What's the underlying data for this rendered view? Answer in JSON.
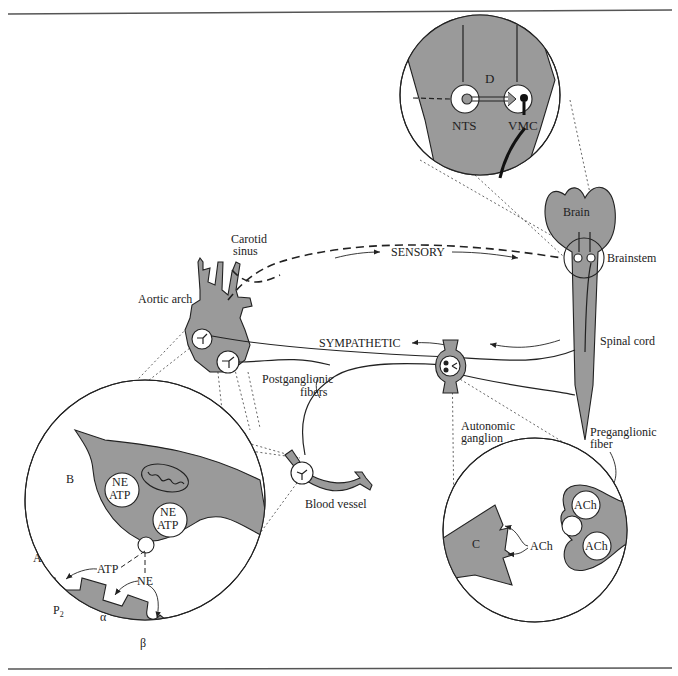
{
  "figure": {
    "labels": {
      "panel_d": "D",
      "nts": "NTS",
      "vmc": "VMC",
      "brain": "Brain",
      "brainstem": "Brainstem",
      "spinal_cord": "Spinal cord",
      "carotid_sinus_1": "Carotid",
      "carotid_sinus_2": "sinus",
      "aortic_arch": "Aortic arch",
      "sensory": "SENSORY",
      "sympathetic": "SYMPATHETIC",
      "postganglionic_1": "Postganglionic",
      "postganglionic_2": "fibers",
      "autonomic_ganglion_1": "Autonomic",
      "autonomic_ganglion_2": "ganglion",
      "preganglionic_1": "Preganglionic",
      "preganglionic_2": "fiber",
      "blood_vessel": "Blood vessel",
      "panel_b": "B",
      "panel_a": "A",
      "panel_c": "C",
      "ne": "NE",
      "atp": "ATP",
      "p2": "P",
      "p2_sub": "2",
      "alpha": "α",
      "beta": "β",
      "ach": "ACh"
    },
    "colors": {
      "tissue_fill": "#9a9a9a",
      "line": "#222222",
      "background": "#ffffff"
    }
  }
}
